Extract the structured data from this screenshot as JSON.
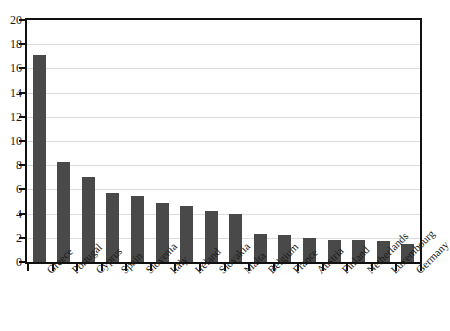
{
  "chart_data": {
    "type": "bar",
    "title": "",
    "subtitle": "",
    "xlabel": "",
    "ylabel": "",
    "ylim": [
      0,
      20
    ],
    "ytick_step": 2,
    "yticks": [
      0,
      2,
      4,
      6,
      8,
      10,
      12,
      14,
      16,
      18,
      20
    ],
    "ytick_labels": [
      "0",
      "2",
      "4",
      "6",
      "8",
      "10",
      "12",
      "14",
      "16",
      "18",
      "20"
    ],
    "grid": true,
    "grid_axis": "y",
    "legend": false,
    "legend_position": "none",
    "categories": [
      "Greece",
      "Portugal",
      "Cyprus",
      "Spain",
      "Slovenia",
      "Italy",
      "Ireland",
      "Slovakia",
      "Malta",
      "Belgium",
      "France",
      "Austria",
      "Finland",
      "Netherlands",
      "Luxembourg",
      "Germany"
    ],
    "values": [
      17.1,
      8.3,
      7.0,
      5.7,
      5.45,
      4.9,
      4.6,
      4.2,
      3.95,
      2.35,
      2.2,
      1.95,
      1.8,
      1.8,
      1.7,
      1.5
    ],
    "bar_color": "#494949",
    "grid_color": "#dcdcdc",
    "axis_color": "#111111",
    "background_color": "#ffffff"
  }
}
